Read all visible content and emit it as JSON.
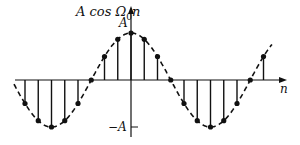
{
  "figure": {
    "ylabel": "A cos Ω₀n",
    "ylabel_parts": {
      "pre": "A cos Ω",
      "sub": "0",
      "post": "n"
    },
    "xlabel": "n",
    "tick_pos_label": "A",
    "tick_neg_label": "−A",
    "colors": {
      "ink": "#111111",
      "background": "#ffffff"
    }
  },
  "chart_data": {
    "type": "stem",
    "xlabel": "n",
    "ylabel": "A cos Ω₀n",
    "period_samples": 12,
    "n": [
      -8,
      -7,
      -6,
      -5,
      -4,
      -3,
      -2,
      -1,
      0,
      1,
      2,
      3,
      4,
      5,
      6,
      7,
      8,
      9,
      10
    ],
    "values_normalized": [
      -0.5,
      -0.866,
      -1,
      -0.866,
      -0.5,
      0,
      0.5,
      0.866,
      1,
      0.866,
      0.5,
      0,
      -0.5,
      -0.866,
      -1,
      -0.866,
      -0.5,
      0,
      0.5
    ],
    "envelope": "dashed continuous cosine",
    "ylim": [
      "-A",
      "A"
    ],
    "yticks": [
      "A",
      "-A"
    ]
  }
}
